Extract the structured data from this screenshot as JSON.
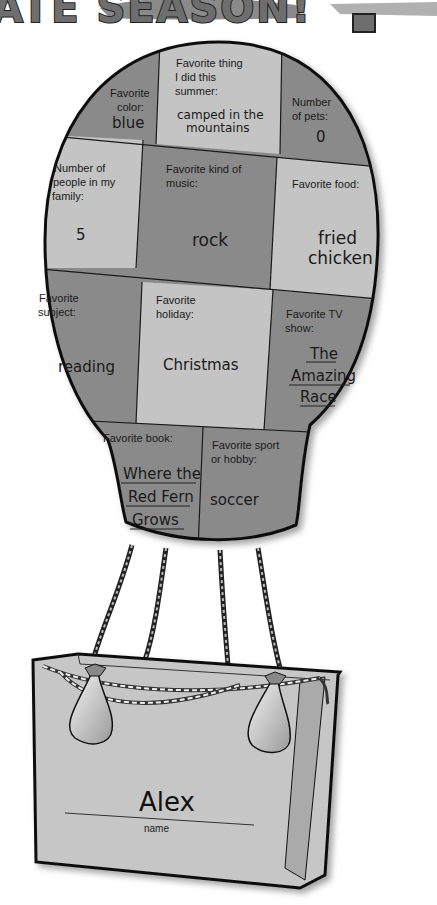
{
  "page": {
    "title_banner": "ATE SEASON!",
    "palette": {
      "dark_cell": "#8a8a8a",
      "light_cell": "#c4c4c4",
      "outline": "#111111",
      "basket": "#c6c6c6",
      "background": "#ffffff"
    }
  },
  "balloon": {
    "cells": [
      {
        "id": "color",
        "label": [
          "Favorite",
          "color:"
        ],
        "answer": [
          "blue"
        ]
      },
      {
        "id": "summer",
        "label": [
          "Favorite thing",
          "I did this",
          "summer:"
        ],
        "answer": [
          "camped in the",
          "mountains"
        ]
      },
      {
        "id": "pets",
        "label": [
          "Number",
          "of pets:"
        ],
        "answer": [
          "0"
        ]
      },
      {
        "id": "family",
        "label": [
          "Number of",
          "people in my",
          "family:"
        ],
        "answer": [
          "5"
        ]
      },
      {
        "id": "music",
        "label": [
          "Favorite kind of",
          "music:"
        ],
        "answer": [
          "rock"
        ]
      },
      {
        "id": "food",
        "label": [
          "Favorite food:"
        ],
        "answer": [
          "fried",
          "chicken"
        ]
      },
      {
        "id": "subject",
        "label": [
          "Favorite",
          "subject:"
        ],
        "answer": [
          "reading"
        ]
      },
      {
        "id": "holiday",
        "label": [
          "Favorite",
          "holiday:"
        ],
        "answer": [
          "Christmas"
        ]
      },
      {
        "id": "tv",
        "label": [
          "Favorite TV",
          "show:"
        ],
        "answer": [
          "The",
          "Amazing",
          "Race"
        ]
      },
      {
        "id": "book",
        "label": [
          "Favorite book:"
        ],
        "answer": [
          "Where the",
          "Red Fern",
          "Grows"
        ]
      },
      {
        "id": "sport",
        "label": [
          "Favorite sport",
          "or hobby:"
        ],
        "answer": [
          "soccer"
        ]
      }
    ]
  },
  "basket": {
    "name_value": "Alex",
    "name_label": "name"
  }
}
